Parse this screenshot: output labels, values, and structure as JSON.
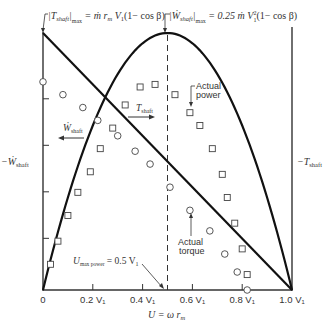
{
  "chart_data": {
    "type": "line",
    "title": "",
    "xlabel": "U = ω r_m",
    "ylabel_left": "−Ẇ_shaft",
    "ylabel_right": "−T_shaft",
    "xlim": [
      0,
      1.0
    ],
    "ylim": [
      0,
      1.0
    ],
    "grid": false,
    "x_ticks": [
      {
        "value": 0,
        "label": "0"
      },
      {
        "value": 0.2,
        "label": "0.2 V₁"
      },
      {
        "value": 0.4,
        "label": "0.4 V₁"
      },
      {
        "value": 0.6,
        "label": "0.6 V₁"
      },
      {
        "value": 0.8,
        "label": "0.8 V₁"
      },
      {
        "value": 1.0,
        "label": "1.0 V₁"
      }
    ],
    "left_axis_ticks": [
      0.2,
      0.4,
      0.6,
      0.8
    ],
    "series": [
      {
        "name": "Ideal power (Ẇ_shaft)",
        "kind": "parabola",
        "description": "4x(1−x)",
        "peak": [
          0.5,
          1.0
        ]
      },
      {
        "name": "Ideal torque (T_shaft)",
        "kind": "line",
        "points": [
          [
            0,
            1.0
          ],
          [
            1.0,
            0
          ]
        ]
      },
      {
        "name": "Actual power",
        "marker": "square",
        "x": [
          0.03,
          0.06,
          0.1,
          0.14,
          0.19,
          0.23,
          0.28,
          0.33,
          0.39,
          0.45,
          0.53,
          0.59,
          0.63,
          0.68,
          0.72,
          0.74,
          0.77,
          0.8,
          0.82
        ],
        "y": [
          0.1,
          0.19,
          0.29,
          0.38,
          0.46,
          0.55,
          0.63,
          0.72,
          0.79,
          0.8,
          0.76,
          0.69,
          0.64,
          0.55,
          0.45,
          0.36,
          0.26,
          0.16,
          0.06
        ]
      },
      {
        "name": "Actual torque",
        "marker": "circle",
        "x": [
          0.0,
          0.08,
          0.16,
          0.22,
          0.3,
          0.37,
          0.43,
          0.51,
          0.59,
          0.67,
          0.73,
          0.78,
          0.82
        ],
        "y": [
          0.81,
          0.76,
          0.71,
          0.66,
          0.6,
          0.54,
          0.49,
          0.4,
          0.31,
          0.23,
          0.14,
          0.07,
          0.0
        ]
      }
    ],
    "vertical_marker": {
      "x": 0.5,
      "style": "dashed"
    },
    "annotations": [
      {
        "id": "torque_max",
        "text": "|T_shaft|max = ṁ r_m V₁(1 − cos β)"
      },
      {
        "id": "power_max",
        "text": "|Ẇ_shaft|max = 0.25 ṁ V₁²(1 − cos β)"
      },
      {
        "id": "u_max_power",
        "text": "U_max power = 0.5 V₁"
      },
      {
        "id": "actual_power",
        "text_line1": "Actual",
        "text_line2": "power"
      },
      {
        "id": "actual_torque",
        "text_line1": "Actual",
        "text_line2": "torque"
      },
      {
        "id": "w_shaft_arrow",
        "text": "Ẇshaft"
      },
      {
        "id": "t_shaft_arrow",
        "text": "Tshaft"
      }
    ]
  },
  "labels": {
    "torque_max_pre": "|T",
    "torque_max_sub": "shaft",
    "torque_max_mid": "|",
    "torque_max_sub2": "max",
    "torque_max_post": " = ṁ r",
    "torque_max_sub3": "m",
    "torque_max_end": " V",
    "torque_max_sub4": "1",
    "torque_max_tail": "(1− cos β)",
    "power_max_pre": "|Ẇ",
    "power_max_sub": "shaft",
    "power_max_mid": "|",
    "power_max_sub2": "max",
    "power_max_post": " = 0.25 ṁ V",
    "power_max_sup": "2",
    "power_max_sub3": "1",
    "power_max_tail": "(1− cos β)",
    "left_axis_pre": "−Ẇ",
    "left_axis_sub": "shaft",
    "right_axis_pre": "−T",
    "right_axis_sub": "shaft",
    "w_arrow_main": "Ẇ",
    "w_arrow_sub": "shaft",
    "t_arrow_main": "T",
    "t_arrow_sub": "shaft",
    "actual_power_1": "Actual",
    "actual_power_2": "power",
    "actual_torque_1": "Actual",
    "actual_torque_2": "torque",
    "umax_pre": "U",
    "umax_sub": "max power",
    "umax_post": " = 0.5 V",
    "umax_sub2": "1",
    "xlabel_pre": "U = ω r",
    "xlabel_sub": "m"
  }
}
